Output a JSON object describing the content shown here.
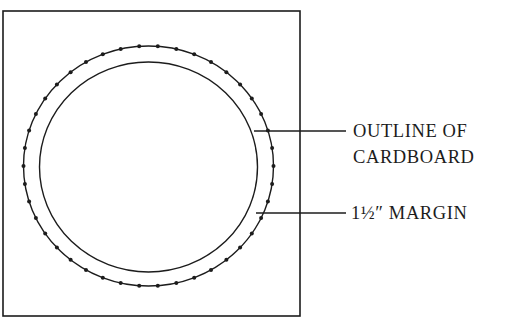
{
  "diagram": {
    "type": "template-layout",
    "square": {
      "x": 3,
      "y": 11,
      "width": 297,
      "height": 305
    },
    "outer_circle": {
      "cx": 148.5,
      "cy": 166,
      "rx": 125,
      "ry": 120,
      "dotted": true,
      "dot_count": 42
    },
    "inner_circle": {
      "cx": 148.5,
      "cy": 167,
      "rx": 109,
      "ry": 105
    },
    "labels": [
      {
        "id": "outline",
        "line1": "OUTLINE OF",
        "line2": "CARDBOARD",
        "leader_y": 131
      },
      {
        "id": "margin",
        "line1": "1½″ MARGIN",
        "leader_y": 213
      }
    ],
    "colors": {
      "ink": "#1c1c1c",
      "background": "#ffffff"
    }
  }
}
